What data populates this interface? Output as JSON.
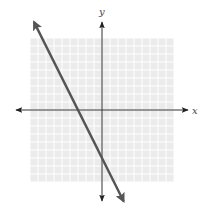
{
  "chart_data": {
    "type": "line",
    "title": "",
    "xlabel": "x",
    "ylabel": "y",
    "xlim": [
      -9,
      9
    ],
    "ylim": [
      -9,
      9
    ],
    "grid": true,
    "grid_step": 1,
    "series": [
      {
        "name": "line",
        "equation": "y = -2x - 6",
        "slope": -2,
        "intercept": -6,
        "x_intercept": -3,
        "y_intercept": -6,
        "x": [
          -8.5,
          2.7
        ],
        "y": [
          11,
          -11.4
        ],
        "color": "#555555"
      }
    ]
  },
  "colors": {
    "grid_background": "#ebebeb",
    "grid_lines": "#ffffff",
    "axes": "#333333",
    "line": "#555555"
  }
}
